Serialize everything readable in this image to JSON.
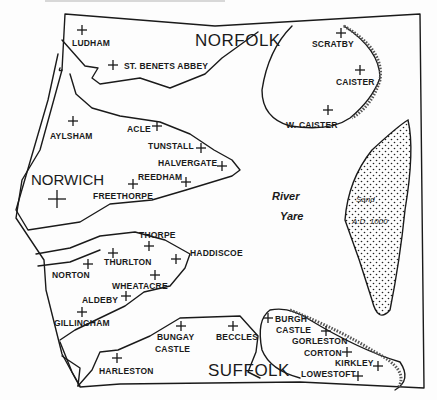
{
  "map": {
    "regions": [
      {
        "id": "norfolk",
        "label": "NORFOLK",
        "x": 195,
        "y": 46
      },
      {
        "id": "suffolk",
        "label": "SUFFOLK",
        "x": 208,
        "y": 370
      }
    ],
    "city": {
      "label": "NORWICH",
      "x": 31,
      "y": 185,
      "cross_x": 57,
      "cross_y": 199
    },
    "river": {
      "line1": "River",
      "line2": "Yare"
    },
    "sandbank": {
      "line1": "Sand",
      "line2": "A.D. 1000"
    },
    "places": [
      {
        "name": "LUDHAM",
        "label_x": 72,
        "label_y": 46,
        "cross_x": 82,
        "cross_y": 30
      },
      {
        "name": "ST. BENETS ABBEY",
        "label_x": 124,
        "label_y": 69,
        "cross_x": 113,
        "cross_y": 65
      },
      {
        "name": "SCRATBY",
        "label_x": 312,
        "label_y": 47,
        "cross_x": 341,
        "cross_y": 33
      },
      {
        "name": "CAISTER",
        "label_x": 336,
        "label_y": 85,
        "cross_x": 360,
        "cross_y": 70
      },
      {
        "name": "W. CAISTER",
        "label_x": 286,
        "label_y": 128,
        "cross_x": 328,
        "cross_y": 110
      },
      {
        "name": "AYLSHAM",
        "label_x": 50,
        "label_y": 139,
        "cross_x": 73,
        "cross_y": 121
      },
      {
        "name": "ACLE",
        "label_x": 127,
        "label_y": 132,
        "cross_x": 157,
        "cross_y": 126
      },
      {
        "name": "TUNSTALL",
        "label_x": 148,
        "label_y": 149,
        "cross_x": 201,
        "cross_y": 148
      },
      {
        "name": "HALVERGATE",
        "label_x": 158,
        "label_y": 166,
        "cross_x": 222,
        "cross_y": 166
      },
      {
        "name": "REEDHAM",
        "label_x": 138,
        "label_y": 180,
        "cross_x": 186,
        "cross_y": 182
      },
      {
        "name": "FREETHORPE",
        "label_x": 93,
        "label_y": 199,
        "cross_x": 133,
        "cross_y": 184
      },
      {
        "name": "THORPE",
        "label_x": 139,
        "label_y": 238,
        "cross_x": 149,
        "cross_y": 246
      },
      {
        "name": "HADDISCOE",
        "label_x": 190,
        "label_y": 256,
        "cross_x": 176,
        "cross_y": 259
      },
      {
        "name": "THURLTON",
        "label_x": 104,
        "label_y": 265,
        "cross_x": 113,
        "cross_y": 253
      },
      {
        "name": "NORTON",
        "label_x": 52,
        "label_y": 278,
        "cross_x": 88,
        "cross_y": 264
      },
      {
        "name": "WHEATACRE",
        "label_x": 112,
        "label_y": 289,
        "cross_x": 155,
        "cross_y": 275
      },
      {
        "name": "ALDEBY",
        "label_x": 82,
        "label_y": 303,
        "cross_x": 126,
        "cross_y": 296
      },
      {
        "name": "GILLINGHAM",
        "label_x": 54,
        "label_y": 326,
        "cross_x": 82,
        "cross_y": 312
      },
      {
        "name": "BUNGAY",
        "label_x": 157,
        "label_y": 340,
        "cross_x": 181,
        "cross_y": 326
      },
      {
        "name": "CASTLE",
        "label_x": 155,
        "label_y": 352,
        "cross_x": null,
        "cross_y": null
      },
      {
        "name": "BECCLES",
        "label_x": 216,
        "label_y": 340,
        "cross_x": 233,
        "cross_y": 326
      },
      {
        "name": "HARLESTON",
        "label_x": 99,
        "label_y": 374,
        "cross_x": 117,
        "cross_y": 358
      },
      {
        "name": "BURGH",
        "label_x": 275,
        "label_y": 322,
        "cross_x": 268,
        "cross_y": 318
      },
      {
        "name": "CASTLE",
        "label_x": 276,
        "label_y": 333,
        "cross_x": 326,
        "cross_y": 331
      },
      {
        "name": "GORLESTON",
        "label_x": 292,
        "label_y": 344,
        "cross_x": null,
        "cross_y": null
      },
      {
        "name": "CORTON",
        "label_x": 304,
        "label_y": 356,
        "cross_x": 347,
        "cross_y": 352
      },
      {
        "name": "KIRKLEY",
        "label_x": 335,
        "label_y": 366,
        "cross_x": 378,
        "cross_y": 366
      },
      {
        "name": "LOWESTOFT",
        "label_x": 301,
        "label_y": 377,
        "cross_x": 358,
        "cross_y": 376
      }
    ]
  }
}
